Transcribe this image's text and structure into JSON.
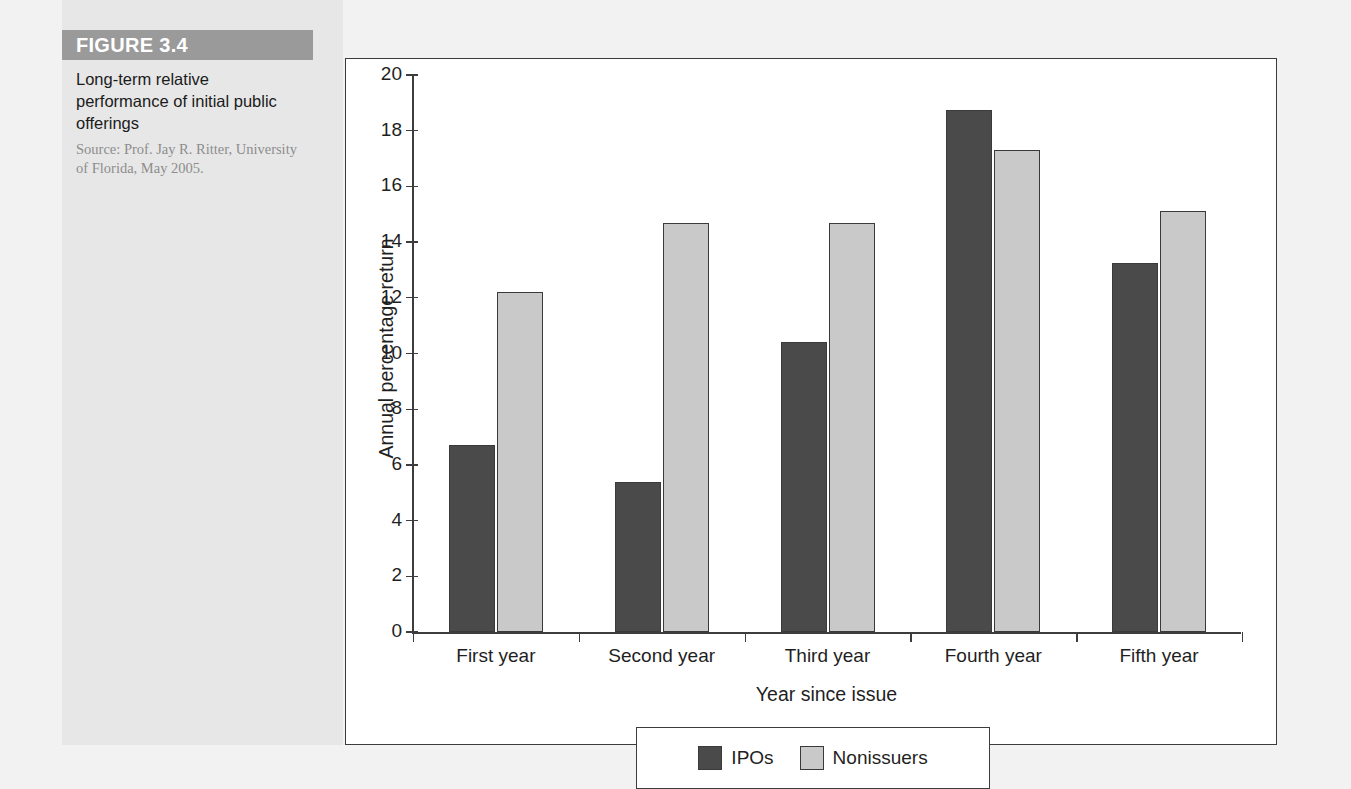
{
  "caption": {
    "figure_banner": "FIGURE 3.4",
    "title": "Long-term relative performance of initial public offerings",
    "source": "Source: Prof. Jay R. Ritter, University of Florida, May 2005."
  },
  "colors": {
    "ipo_bar": "#4a4a4a",
    "nonissuer_bar": "#c9c9c9",
    "banner": "#9a9a9a",
    "panel_bg": "#e7e7e7",
    "page_bg": "#f2f2f2",
    "axis": "#3d3d3d"
  },
  "chart_data": {
    "type": "bar",
    "title": "",
    "xlabel": "Year since issue",
    "ylabel": "Annual percentage return",
    "ylim": [
      0,
      20
    ],
    "ytick_step": 2,
    "yticks": [
      "0",
      "2",
      "4",
      "6",
      "8",
      "10",
      "12",
      "14",
      "16",
      "18",
      "20"
    ],
    "grid": false,
    "legend_position": "bottom",
    "categories": [
      "First year",
      "Second year",
      "Third year",
      "Fourth year",
      "Fifth year"
    ],
    "series": [
      {
        "name": "IPOs",
        "values": [
          6.7,
          5.4,
          10.4,
          18.75,
          13.25
        ]
      },
      {
        "name": "Nonissuers",
        "values": [
          12.2,
          14.7,
          14.7,
          17.3,
          15.1
        ]
      }
    ]
  }
}
